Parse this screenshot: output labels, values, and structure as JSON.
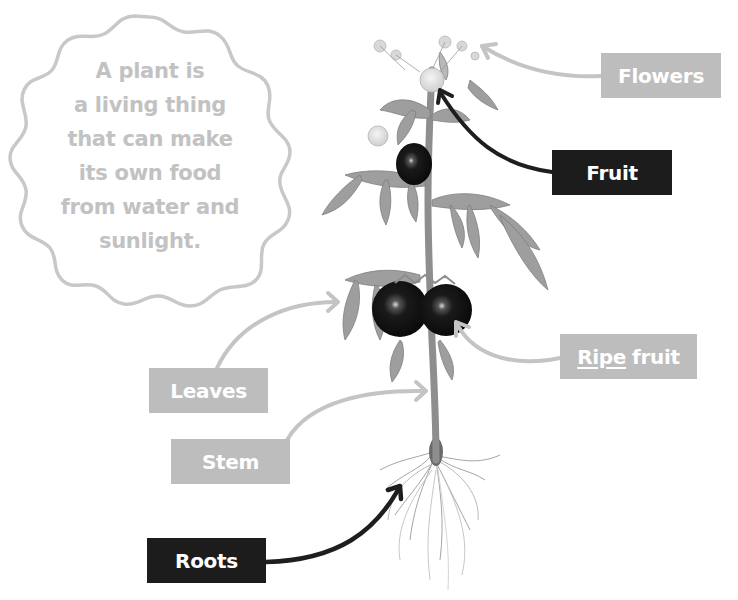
{
  "cloud": {
    "lines": [
      "A plant is",
      "a living thing",
      "that can make",
      "its own food",
      "from water and",
      "sunlight."
    ],
    "text_color": "#c2c2c2",
    "outline_color": "#c8c8c8"
  },
  "labels": {
    "flowers": {
      "text": "Flowers",
      "style": "light"
    },
    "fruit": {
      "text": "Fruit",
      "style": "dark"
    },
    "ripe_fruit": {
      "underlined": "Ripe",
      "rest": "fruit",
      "style": "light"
    },
    "leaves": {
      "text": "Leaves",
      "style": "light"
    },
    "stem": {
      "text": "Stem",
      "style": "light"
    },
    "roots": {
      "text": "Roots",
      "style": "dark"
    }
  },
  "colors": {
    "light_label": "#bdbdbd",
    "dark_label": "#1c1c1c",
    "light_arrow": "#c4c4c4",
    "dark_arrow": "#1e1e1e",
    "leaf": "#9a9a9a",
    "fruit": "#151515"
  }
}
